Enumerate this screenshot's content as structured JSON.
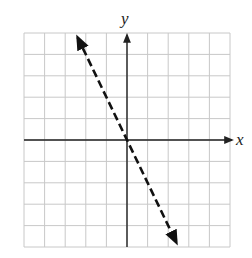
{
  "chart_data": {
    "type": "line",
    "title": "",
    "xlabel": "x",
    "ylabel": "y",
    "xlim": [
      -5,
      5
    ],
    "ylim": [
      -5,
      5
    ],
    "grid": true,
    "grid_step": 1,
    "legend": null,
    "series": [
      {
        "name": "y = -2x",
        "style": "dashed",
        "color": "#111111",
        "arrows": "both",
        "x": [
          -2.4,
          2.4
        ],
        "y": [
          4.8,
          -4.8
        ]
      }
    ]
  },
  "colors": {
    "grid": "#c8c8c8",
    "axis": "#222222",
    "line": "#111111",
    "background": "#ffffff"
  }
}
